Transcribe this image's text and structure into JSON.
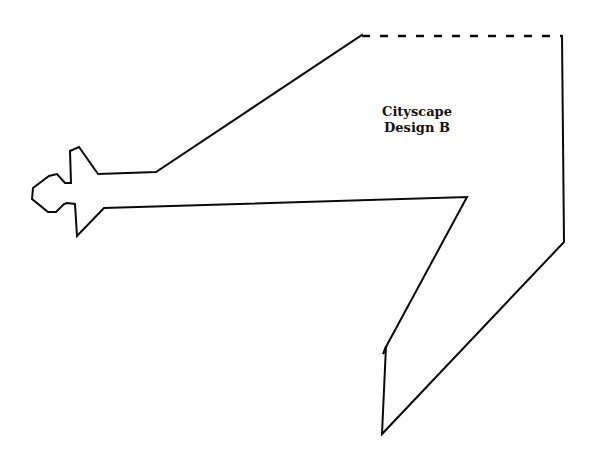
{
  "diagram": {
    "title_line1": "Cityscape",
    "title_line2": "Design B",
    "stroke_color": "#0a0a0a",
    "background_color": "#ffffff",
    "solid_outline_points": "362,35 156,172 98,174 79,147 70,151 71,183 65,183 57,174 49,176 33,188 32,199 48,212 56,212 64,204 67,203 75,204 77,236 104,208 467,197 387,345 383,354 386,346 382,434 564,242 562,36",
    "dashed_edge": {
      "x1": 362,
      "y1": 36,
      "x2": 562,
      "y2": 36
    }
  }
}
